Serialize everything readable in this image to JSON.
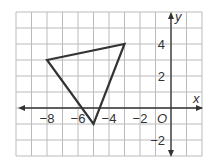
{
  "figure": {
    "type": "coordinate-plane",
    "x_range": [
      -10,
      2
    ],
    "y_range": [
      -3,
      6
    ],
    "grid_step": 1,
    "axis_labels": {
      "x": "x",
      "y": "y",
      "origin": "O"
    },
    "x_ticks": [
      {
        "value": -8,
        "label": "−8"
      },
      {
        "value": -6,
        "label": "−6"
      },
      {
        "value": -4,
        "label": "−4"
      },
      {
        "value": -2,
        "label": "−2"
      }
    ],
    "y_ticks": [
      {
        "value": 4,
        "label": "4"
      },
      {
        "value": 2,
        "label": "2"
      },
      {
        "value": -2,
        "label": "−2"
      }
    ],
    "shapes": [
      {
        "name": "triangle",
        "vertices": [
          [
            -8,
            3
          ],
          [
            -3,
            4
          ],
          [
            -5,
            -1
          ]
        ],
        "stroke": "#333333"
      }
    ],
    "colors": {
      "grid": "#bbbbbb",
      "axis": "#333333",
      "shape": "#333333",
      "background": "#ffffff"
    }
  }
}
